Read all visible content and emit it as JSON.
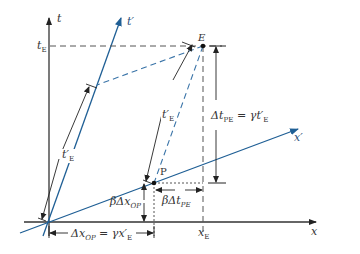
{
  "diagram": {
    "type": "spacetime-diagram",
    "colors": {
      "axis": "#333333",
      "primed_axis": "#1f5f95",
      "dashed_black": "#555555",
      "dashed_blue": "#3a74a8",
      "background": "#ffffff"
    },
    "axes": {
      "t": {
        "label": "t"
      },
      "x": {
        "label": "x"
      },
      "t_prime": {
        "label": "t′"
      },
      "x_prime": {
        "label": "x′"
      }
    },
    "events": {
      "E": {
        "label": "E"
      },
      "P": {
        "label": "P"
      }
    },
    "tick_labels": {
      "t_E": {
        "main": "t",
        "sub": "E"
      },
      "x_E": {
        "main": "x",
        "sub": "E"
      }
    },
    "annotations": {
      "t_prime_E_left": {
        "main": "t′",
        "sub": "E"
      },
      "t_prime_E_right": {
        "main": "t′",
        "sub": "E"
      },
      "delta_t_PE": {
        "lhs": "Δt",
        "lhs_sub": "PE",
        "eq": " = γt′",
        "rhs_sub": "E"
      },
      "delta_x_OP": {
        "lhs": "Δx",
        "lhs_sub": "OP",
        "eq": " = γx′",
        "rhs_sub": "E"
      },
      "beta_delta_x_OP": {
        "main": "βΔx",
        "sub": "OP"
      },
      "beta_delta_t_PE": {
        "main": "βΔt",
        "sub": "PE"
      }
    }
  }
}
